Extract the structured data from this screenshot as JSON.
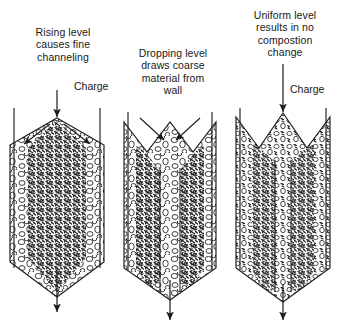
{
  "figure": {
    "background": "#ffffff",
    "ink_color": "#1c1c1c"
  },
  "panels": [
    {
      "id": "panel-rising-level",
      "caption": "Rising level\ncauses fine\nchanneling",
      "charge_label": "Charge",
      "top_profile": "peak",
      "flow_arrows": "diverging-outward",
      "fine_material_zone": "center-column",
      "coarse_material_zone": "near-walls",
      "outlet_arrow": "down"
    },
    {
      "id": "panel-dropping-level",
      "caption": "Dropping level\ndraws coarse\nmaterial from\nwall",
      "charge_label": "",
      "top_profile": "v-notch",
      "flow_arrows": "converging-inward",
      "fine_material_zone": "two-side-bands",
      "coarse_material_zone": "center-channel",
      "outlet_arrow": "down"
    },
    {
      "id": "panel-uniform-level",
      "caption": "Uniform level\nresults in no\ncompostion\nchange",
      "charge_label": "Charge",
      "top_profile": "twin-peak",
      "flow_arrows": "straight-down",
      "fine_material_zone": "evenly-mixed",
      "coarse_material_zone": "evenly-mixed",
      "outlet_arrow": "down"
    }
  ],
  "legend": {
    "fine_particles": "dense dark scribble texture",
    "coarse_particles": "open outlined ellipses"
  }
}
